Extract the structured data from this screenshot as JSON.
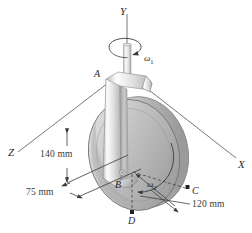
{
  "figure": {
    "background_color": "#ffffff",
    "line_color": "#3a3a3a",
    "body_fill_light": "#f2f2f2",
    "body_fill_mid": "#cfcfcf",
    "body_fill_dark": "#9a9a9a"
  },
  "axes": [
    {
      "id": "y-axis",
      "label": "Y",
      "orientation": "vertical-up"
    },
    {
      "id": "x-axis",
      "label": "X",
      "orientation": "right-down"
    },
    {
      "id": "z-axis",
      "label": "Z",
      "orientation": "left-down"
    }
  ],
  "points": [
    {
      "id": "point-a",
      "label": "A"
    },
    {
      "id": "point-b",
      "label": "B"
    },
    {
      "id": "point-c",
      "label": "C"
    },
    {
      "id": "point-d",
      "label": "D"
    }
  ],
  "angular_velocities": [
    {
      "id": "omega-1",
      "symbol": "ω",
      "subscript": "1",
      "about": "Y axis"
    },
    {
      "id": "omega-2",
      "symbol": "ω",
      "subscript": "2",
      "about": "disk spin axis"
    }
  ],
  "dimensions": [
    {
      "id": "dim-140",
      "value": "140 mm",
      "orientation": "vertical"
    },
    {
      "id": "dim-75",
      "value": "75 mm",
      "orientation": "horizontal"
    },
    {
      "id": "dim-120",
      "value": "120 mm",
      "orientation": "radial"
    }
  ]
}
